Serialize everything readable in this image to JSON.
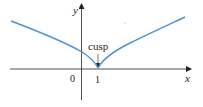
{
  "diagram": {
    "type": "function-graph",
    "axes": {
      "x_label": "x",
      "y_label": "y",
      "origin_label": "0",
      "tick_labels": [
        "1"
      ]
    },
    "annotation": {
      "label": "cusp",
      "point": {
        "x": 1,
        "y": 0
      }
    },
    "colors": {
      "curve": "#4a90d9",
      "axes": "#231f20",
      "text": "#231f20"
    }
  }
}
